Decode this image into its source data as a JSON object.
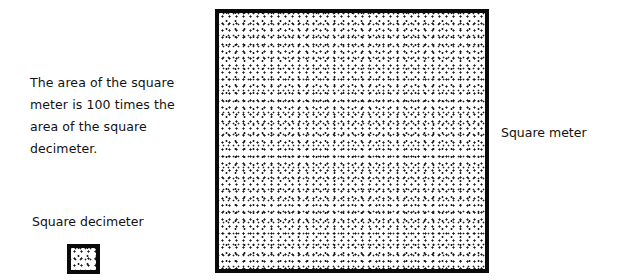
{
  "caption": {
    "lines": [
      "The area of the square",
      "meter is 100 times the",
      "area of the square",
      "decimeter."
    ]
  },
  "labels": {
    "square_meter": "Square meter",
    "square_decimeter": "Square decimeter"
  },
  "shapes": {
    "square_meter": {
      "fill": "stippled",
      "border_color": "#0a0a0a"
    },
    "square_decimeter": {
      "fill": "stippled",
      "border_color": "#0a0a0a"
    }
  },
  "relationship": {
    "ratio": 100
  }
}
